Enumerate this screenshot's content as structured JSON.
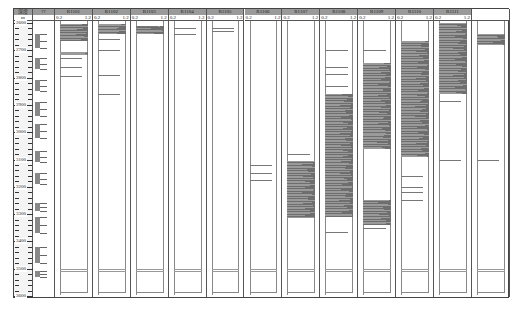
{
  "chart_data": {
    "type": "heatmap",
    "title": "",
    "depth_header": "深度",
    "depth_unit": "m",
    "depth_range": [
      2600,
      3600
    ],
    "depth_ticks": [
      2600,
      2700,
      2800,
      2900,
      3000,
      3100,
      3200,
      3300,
      3400,
      3500,
      3600
    ],
    "second_column_header": "???",
    "track_scale_min": "0.2",
    "track_scale_max": "1.2",
    "tracks": [
      {
        "name": "R1101",
        "intervals": [
          [
            2605,
            2665
          ],
          [
            2705,
            2712
          ],
          [
            2712,
            2718
          ]
        ]
      },
      {
        "name": "R1102",
        "intervals": [
          [
            2602,
            2625
          ],
          [
            2625,
            2640
          ]
        ]
      },
      {
        "name": "R1103",
        "intervals": [
          [
            2612,
            2642
          ]
        ]
      },
      {
        "name": "R1104",
        "intervals": []
      },
      {
        "name": "R1105",
        "intervals": []
      },
      {
        "name": "R1106",
        "intervals": []
      },
      {
        "name": "R1107",
        "intervals": [
          [
            3105,
            3315
          ]
        ]
      },
      {
        "name": "R1108",
        "intervals": [
          [
            2860,
            3310
          ]
        ]
      },
      {
        "name": "R1109",
        "intervals": [
          [
            2745,
            3005
          ],
          [
            3005,
            3060
          ],
          [
            3250,
            3340
          ]
        ]
      },
      {
        "name": "R1110",
        "intervals": [
          [
            2665,
            2915
          ],
          [
            2915,
            3090
          ]
        ]
      },
      {
        "name": "R1111",
        "intervals": [
          [
            2600,
            2860
          ]
        ]
      },
      {
        "name": "",
        "intervals": [
          [
            2640,
            2680
          ]
        ]
      }
    ]
  },
  "header": {
    "depth_label": "深度",
    "unit_label": "m",
    "second_col_label": "??"
  },
  "depth_labels": [
    "2600",
    "2700",
    "2800",
    "2900",
    "3000",
    "3100",
    "3200",
    "3300",
    "3400",
    "3500",
    "3600"
  ],
  "tracks": [
    {
      "name": "R1101",
      "min": "0.2",
      "max": "1.2"
    },
    {
      "name": "R1102",
      "min": "0.2",
      "max": "1.2"
    },
    {
      "name": "R1103",
      "min": "0.2",
      "max": "1.2"
    },
    {
      "name": "R1104",
      "min": "0.2",
      "max": "1.2"
    },
    {
      "name": "R1105",
      "min": "0.2",
      "max": "1.2"
    },
    {
      "name": "R1106",
      "min": "0.2",
      "max": "1.2"
    },
    {
      "name": "R1107",
      "min": "0.2",
      "max": "1.2"
    },
    {
      "name": "R1108",
      "min": "0.2",
      "max": "1.2"
    },
    {
      "name": "R1109",
      "min": "0.2",
      "max": "1.2"
    },
    {
      "name": "R1110",
      "min": "0.2",
      "max": "1.2"
    },
    {
      "name": "R1111",
      "min": "0.2",
      "max": "1.2"
    },
    {
      "name": "",
      "min": "",
      "max": ""
    }
  ]
}
